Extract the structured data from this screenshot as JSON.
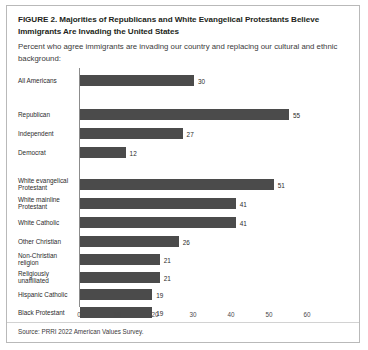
{
  "figure": {
    "title": "FIGURE 2.  Majorities of Republicans and White Evangelical Protestants Believe Immigrants Are Invading the United States",
    "subtitle": "Percent who agree immigrants are invading our country and replacing our cultural and ethnic background:",
    "source": "Source: PRRI 2022 American Values Survey."
  },
  "chart_data": {
    "type": "bar",
    "orientation": "horizontal",
    "title": "FIGURE 2.  Majorities of Republicans and White Evangelical Protestants Believe Immigrants Are Invading the United States",
    "subtitle": "Percent who agree immigrants are invading our country and replacing our cultural and ethnic background:",
    "xlabel": "",
    "ylabel": "",
    "xlim": [
      0,
      60
    ],
    "xticks": [
      0,
      10,
      20,
      30,
      40,
      50,
      60
    ],
    "grid": false,
    "legend": null,
    "bar_color": "#4b4b4b",
    "categories": [
      "All Americans",
      "Republican",
      "Independent",
      "Democrat",
      "White evangelical Protestant",
      "White mainline Protestant",
      "White Catholic",
      "Other Christian",
      "Non-Christian religion",
      "Religiously unaffiliated",
      "Hispanic Catholic",
      "Black Protestant"
    ],
    "values": [
      30,
      55,
      27,
      12,
      51,
      41,
      41,
      26,
      21,
      21,
      19,
      19
    ],
    "groups": [
      {
        "name": "overall",
        "categories": [
          "All Americans"
        ]
      },
      {
        "name": "party",
        "categories": [
          "Republican",
          "Independent",
          "Democrat"
        ]
      },
      {
        "name": "religion",
        "categories": [
          "White evangelical Protestant",
          "White mainline Protestant",
          "White Catholic",
          "Other Christian",
          "Non-Christian religion",
          "Religiously unaffiliated",
          "Hispanic Catholic",
          "Black Protestant"
        ]
      }
    ]
  },
  "bars": [
    {
      "label_line1": "All Americans",
      "label_line2": "",
      "value": "30",
      "v": 30,
      "top": 8
    },
    {
      "label_line1": "Republican",
      "label_line2": "",
      "value": "55",
      "v": 55,
      "top": 42
    },
    {
      "label_line1": "Independent",
      "label_line2": "",
      "value": "27",
      "v": 27,
      "top": 61
    },
    {
      "label_line1": "Democrat",
      "label_line2": "",
      "value": "12",
      "v": 12,
      "top": 80
    },
    {
      "label_line1": "White evangelical",
      "label_line2": "Protestant",
      "value": "51",
      "v": 51,
      "top": 114
    },
    {
      "label_line1": "White mainline",
      "label_line2": "Protestant",
      "value": "41",
      "v": 41,
      "top": 134
    },
    {
      "label_line1": "White Catholic",
      "label_line2": "",
      "value": "41",
      "v": 41,
      "top": 154
    },
    {
      "label_line1": "Other Christian",
      "label_line2": "",
      "value": "26",
      "v": 26,
      "top": 174
    },
    {
      "label_line1": "Non-Christian",
      "label_line2": "religion",
      "value": "21",
      "v": 21,
      "top": 192
    },
    {
      "label_line1": "Religiously",
      "label_line2": "unaffiliated",
      "value": "21",
      "v": 21,
      "top": 210
    },
    {
      "label_line1": "Hispanic Catholic",
      "label_line2": "",
      "value": "19",
      "v": 19,
      "top": 208
    },
    {
      "label_line1": "Black Protestant",
      "label_line2": "",
      "value": "19",
      "v": 19,
      "top": 226
    }
  ],
  "xaxis": {
    "ticks": [
      "0",
      "10",
      "20",
      "30",
      "40",
      "50",
      "60"
    ]
  }
}
